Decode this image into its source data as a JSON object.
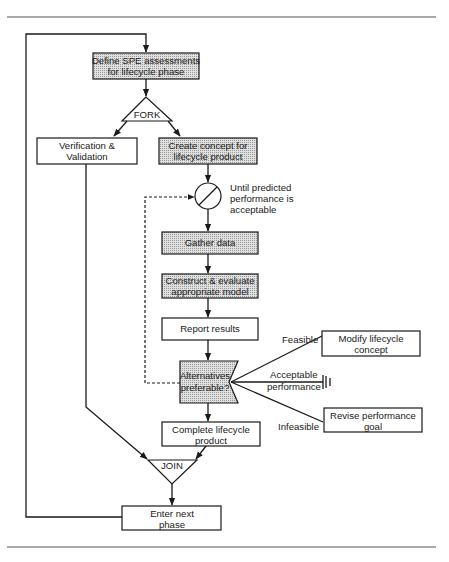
{
  "diagram": {
    "colors": {
      "shaded_fill": "#cfcfcf",
      "plain_fill": "#ffffff",
      "stroke": "#1a1a1a",
      "rule": "#555555"
    },
    "nodes": {
      "define": {
        "line1": "Define SPE assessments",
        "line2": "for lifecycle phase",
        "shaded": true
      },
      "fork": {
        "label": "FORK"
      },
      "verify": {
        "line1": "Verification &",
        "line2": "Validation",
        "shaded": false
      },
      "create": {
        "line1": "Create concept for",
        "line2": "lifecycle product",
        "shaded": true
      },
      "loop": {
        "line1": "Until predicted",
        "line2": "performance is",
        "line3": "acceptable"
      },
      "gather": {
        "line1": "Gather data",
        "shaded": true
      },
      "construct": {
        "line1": "Construct & evaluate",
        "line2": "appropriate model",
        "shaded": true
      },
      "report": {
        "line1": "Report results",
        "shaded": false
      },
      "alternatives": {
        "line1": "Alternatives",
        "line2": "preferable?",
        "shaded": true
      },
      "modify": {
        "line1": "Modify lifecycle",
        "line2": "concept",
        "shaded": false
      },
      "revise": {
        "line1": "Revise performance",
        "line2": "goal",
        "shaded": false
      },
      "complete": {
        "line1": "Complete lifecycle",
        "line2": "product",
        "shaded": false
      },
      "join": {
        "label": "JOIN"
      },
      "enter": {
        "line1": "Enter next",
        "line2": "phase",
        "shaded": false
      }
    },
    "edge_labels": {
      "feasible": "Feasible",
      "acceptable_line1": "Acceptable",
      "acceptable_line2": "performance",
      "infeasible": "Infeasible"
    }
  }
}
